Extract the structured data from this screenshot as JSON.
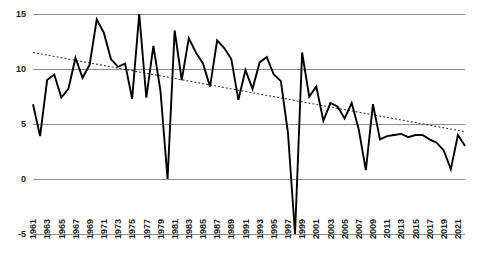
{
  "chart_data": {
    "type": "line",
    "title": "",
    "subtitle": "",
    "xlabel": "",
    "ylabel": "",
    "xlim": [
      1961,
      2022
    ],
    "ylim": [
      -5,
      15
    ],
    "yticks": [
      15,
      10,
      5,
      0,
      -5
    ],
    "ytick_labels": [
      "15",
      "10",
      "5",
      "0",
      "-5"
    ],
    "grid": true,
    "grid_axis": "y",
    "legend": false,
    "legend_position": "none",
    "x": [
      1961,
      1962,
      1963,
      1964,
      1965,
      1966,
      1967,
      1968,
      1969,
      1970,
      1971,
      1972,
      1973,
      1974,
      1975,
      1976,
      1977,
      1978,
      1979,
      1980,
      1981,
      1982,
      1983,
      1984,
      1985,
      1986,
      1987,
      1988,
      1989,
      1990,
      1991,
      1992,
      1993,
      1994,
      1995,
      1996,
      1997,
      1998,
      1999,
      2000,
      2001,
      2002,
      2003,
      2004,
      2005,
      2006,
      2007,
      2008,
      2009,
      2010,
      2011,
      2012,
      2013,
      2014,
      2015,
      2016,
      2017,
      2018,
      2019,
      2020,
      2021,
      2022
    ],
    "xtick_labels": [
      "1961",
      "1963",
      "1965",
      "1967",
      "1969",
      "1971",
      "1973",
      "1975",
      "1977",
      "1979",
      "1981",
      "1983",
      "1985",
      "1987",
      "1989",
      "1991",
      "1993",
      "1995",
      "1997",
      "1999",
      "2001",
      "2003",
      "2005",
      "2007",
      "2009",
      "2011",
      "2013",
      "2015",
      "2017",
      "2019",
      "2021"
    ],
    "xtick_step": 2,
    "series": [
      {
        "name": "value",
        "style": "solid",
        "color": "#000000",
        "values": [
          6.8,
          3.9,
          9.0,
          9.5,
          7.4,
          8.2,
          11.0,
          9.2,
          10.4,
          14.5,
          13.3,
          10.9,
          10.2,
          10.5,
          7.3,
          15.0,
          7.4,
          12.1,
          8.0,
          0.0,
          13.5,
          9.0,
          12.8,
          11.5,
          10.5,
          8.4,
          12.6,
          11.9,
          10.9,
          7.2,
          9.9,
          8.2,
          10.6,
          11.1,
          9.5,
          8.9,
          4.2,
          -5.0,
          11.5,
          7.5,
          8.4,
          5.3,
          6.9,
          6.6,
          5.5,
          6.9,
          4.5,
          0.8,
          6.8,
          3.6,
          3.9,
          4.0,
          4.1,
          3.8,
          4.0,
          4.0,
          3.6,
          3.3,
          2.6,
          0.9,
          4.0,
          3.0
        ]
      },
      {
        "name": "trend",
        "style": "dotted",
        "color": "#3a3a3a",
        "trend_start": 11.5,
        "trend_end": 4.3
      }
    ]
  }
}
